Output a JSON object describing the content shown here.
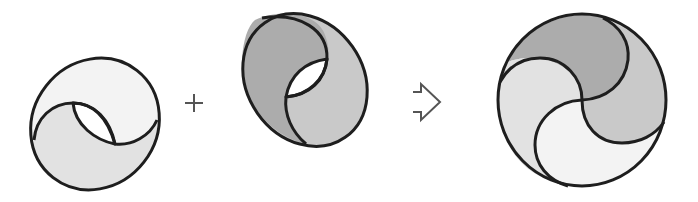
{
  "diagram": {
    "description": "Two ring-like ellipse halves combine to form a four-part swirl circle",
    "operators": {
      "plus": "+",
      "result_arrow": "⇨"
    },
    "parts": [
      {
        "name": "shape-a",
        "role": "operand",
        "label": "Light ring with white lens hole"
      },
      {
        "name": "shape-b",
        "role": "operand",
        "label": "Dark ring with white lens hole"
      },
      {
        "name": "shape-result",
        "role": "result",
        "label": "Four-segment swirl circle"
      }
    ],
    "colors": {
      "stroke": "#1e1e1e",
      "lightest": "#f3f3f3",
      "light": "#e2e2e2",
      "medium": "#c9c9c9",
      "dark": "#acacac",
      "hole": "#ffffff",
      "operator": "#555555"
    }
  }
}
